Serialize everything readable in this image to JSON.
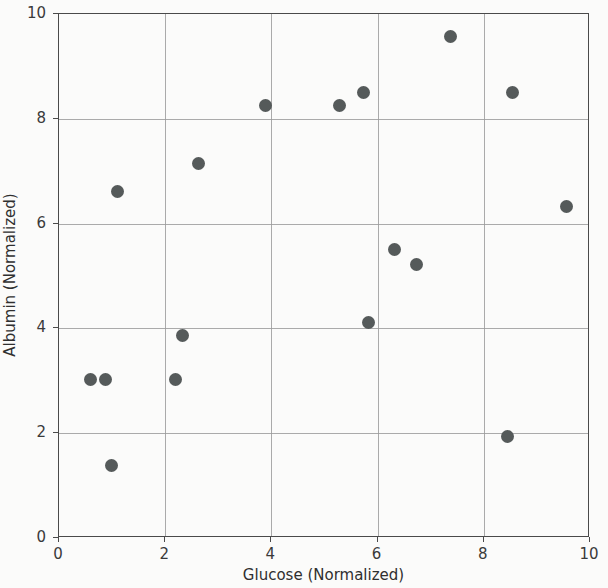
{
  "chart_data": {
    "type": "scatter",
    "title": "",
    "xlabel": "Glucose (Normalized)",
    "ylabel": "Albumin (Normalized)",
    "xlim": [
      0,
      10
    ],
    "ylim": [
      0,
      10
    ],
    "xticks": [
      0,
      2,
      4,
      6,
      8,
      10
    ],
    "yticks": [
      0,
      2,
      4,
      6,
      8,
      10
    ],
    "xticklabels": [
      "0",
      "2",
      "4",
      "6",
      "8",
      "10"
    ],
    "yticklabels": [
      "0",
      "2",
      "4",
      "6",
      "8",
      "10"
    ],
    "grid": true,
    "legend": false,
    "marker_color": "#555a5a",
    "background_color": "#fbfbfa",
    "grid_color": "#9b9b9b",
    "axis_color": "#4a4a4a",
    "points": [
      {
        "x": 0.6,
        "y": 3.02
      },
      {
        "x": 0.87,
        "y": 3.02
      },
      {
        "x": 0.98,
        "y": 1.39
      },
      {
        "x": 1.11,
        "y": 6.62
      },
      {
        "x": 2.2,
        "y": 3.02
      },
      {
        "x": 2.32,
        "y": 3.87
      },
      {
        "x": 2.62,
        "y": 7.15
      },
      {
        "x": 3.88,
        "y": 8.25
      },
      {
        "x": 5.29,
        "y": 8.25
      },
      {
        "x": 5.74,
        "y": 8.5
      },
      {
        "x": 5.82,
        "y": 4.12
      },
      {
        "x": 6.32,
        "y": 5.5
      },
      {
        "x": 6.73,
        "y": 5.22
      },
      {
        "x": 7.38,
        "y": 9.58
      },
      {
        "x": 8.44,
        "y": 1.94
      },
      {
        "x": 8.54,
        "y": 8.5
      },
      {
        "x": 9.56,
        "y": 6.32
      }
    ]
  }
}
